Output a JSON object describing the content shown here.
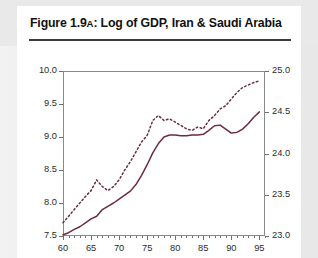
{
  "figure": {
    "title_prefix": "Figure 1.9",
    "title_smallcap": "A",
    "title_rest": ": Log of GDP, Iran & Saudi Arabia"
  },
  "colors": {
    "line": "#6b2b42",
    "axis": "#8a8a8a",
    "rule": "#3a3a3a",
    "page_background": "#e9e9e9",
    "card_background": "#ffffff"
  },
  "chart_data": {
    "type": "line",
    "title": "Figure 1.9A: Log of GDP, Iran & Saudi Arabia",
    "xlabel": "",
    "ylabel": "",
    "grid": false,
    "legend": "none",
    "xlim": [
      60,
      96
    ],
    "x_ticks": [
      60,
      65,
      70,
      75,
      80,
      85,
      90,
      95
    ],
    "x_tick_labels": [
      "60",
      "65",
      "70",
      "75",
      "80",
      "85",
      "90",
      "95"
    ],
    "x_minor_step": 1,
    "left_axis": {
      "label": "Log of GDP (Iran)",
      "ylim": [
        7.5,
        10.0
      ],
      "ticks": [
        7.5,
        8.0,
        8.5,
        9.0,
        9.5,
        10.0
      ],
      "tick_labels": [
        "7.5",
        "8.0",
        "8.5",
        "9.0",
        "9.5",
        "10.0"
      ]
    },
    "right_axis": {
      "label": "Log of GDP (Saudi Arabia)",
      "ylim": [
        23.0,
        25.0
      ],
      "ticks": [
        23.0,
        23.5,
        24.0,
        24.5,
        25.0
      ],
      "tick_labels": [
        "23.0",
        "23.5",
        "24.0",
        "24.5",
        "25.0"
      ]
    },
    "x": [
      60,
      61,
      62,
      63,
      64,
      65,
      66,
      67,
      68,
      69,
      70,
      71,
      72,
      73,
      74,
      75,
      76,
      77,
      78,
      79,
      80,
      81,
      82,
      83,
      84,
      85,
      86,
      87,
      88,
      89,
      90,
      91,
      92,
      93,
      94,
      95
    ],
    "series": [
      {
        "name": "Iran",
        "axis": "left",
        "style": "solid",
        "color": "#6b2b42",
        "values": [
          7.52,
          7.55,
          7.6,
          7.64,
          7.7,
          7.76,
          7.8,
          7.9,
          7.95,
          8.0,
          8.06,
          8.12,
          8.18,
          8.28,
          8.42,
          8.58,
          8.76,
          8.9,
          9.0,
          9.03,
          9.03,
          9.02,
          9.02,
          9.03,
          9.03,
          9.04,
          9.1,
          9.17,
          9.18,
          9.12,
          9.06,
          9.07,
          9.12,
          9.2,
          9.3,
          9.38
        ]
      },
      {
        "name": "Saudi Arabia",
        "axis": "right",
        "style": "dotted",
        "color": "#6b2b42",
        "values": [
          23.16,
          23.24,
          23.32,
          23.4,
          23.48,
          23.55,
          23.68,
          23.6,
          23.55,
          23.6,
          23.68,
          23.8,
          23.9,
          24.02,
          24.14,
          24.22,
          24.4,
          24.46,
          24.4,
          24.42,
          24.38,
          24.34,
          24.3,
          24.28,
          24.32,
          24.3,
          24.4,
          24.46,
          24.54,
          24.58,
          24.66,
          24.74,
          24.8,
          24.83,
          24.86,
          24.88
        ]
      }
    ]
  }
}
